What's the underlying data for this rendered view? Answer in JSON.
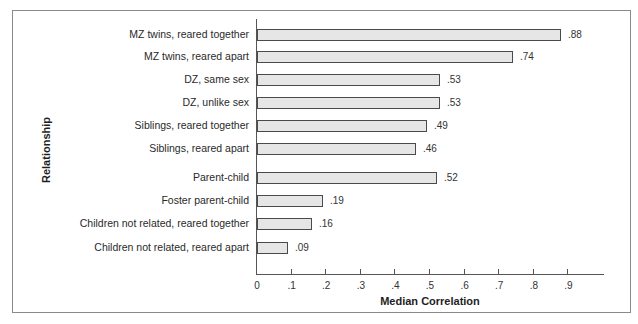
{
  "chart_data": {
    "type": "bar",
    "orientation": "horizontal",
    "title": "",
    "xlabel": "Median Correlation",
    "ylabel": "Relationship",
    "xlim": [
      0,
      1.0
    ],
    "x_ticks": [
      "0",
      ".1",
      ".2",
      ".3",
      ".4",
      ".5",
      ".6",
      ".7",
      ".8",
      ".9"
    ],
    "grid": false,
    "categories": [
      "MZ twins, reared together",
      "MZ twins, reared apart",
      "DZ, same sex",
      "DZ, unlike sex",
      "Siblings, reared together",
      "Siblings, reared apart",
      "Parent-child",
      "Foster parent-child",
      "Children not related, reared together",
      "Children not related, reared apart"
    ],
    "values": [
      0.88,
      0.74,
      0.53,
      0.53,
      0.49,
      0.46,
      0.52,
      0.19,
      0.16,
      0.09
    ],
    "value_labels": [
      ".88",
      ".74",
      ".53",
      ".53",
      ".49",
      ".46",
      ".52",
      ".19",
      ".16",
      ".09"
    ],
    "bar_color": "#e6e6e6",
    "bar_edge_color": "#4a4a4a"
  }
}
